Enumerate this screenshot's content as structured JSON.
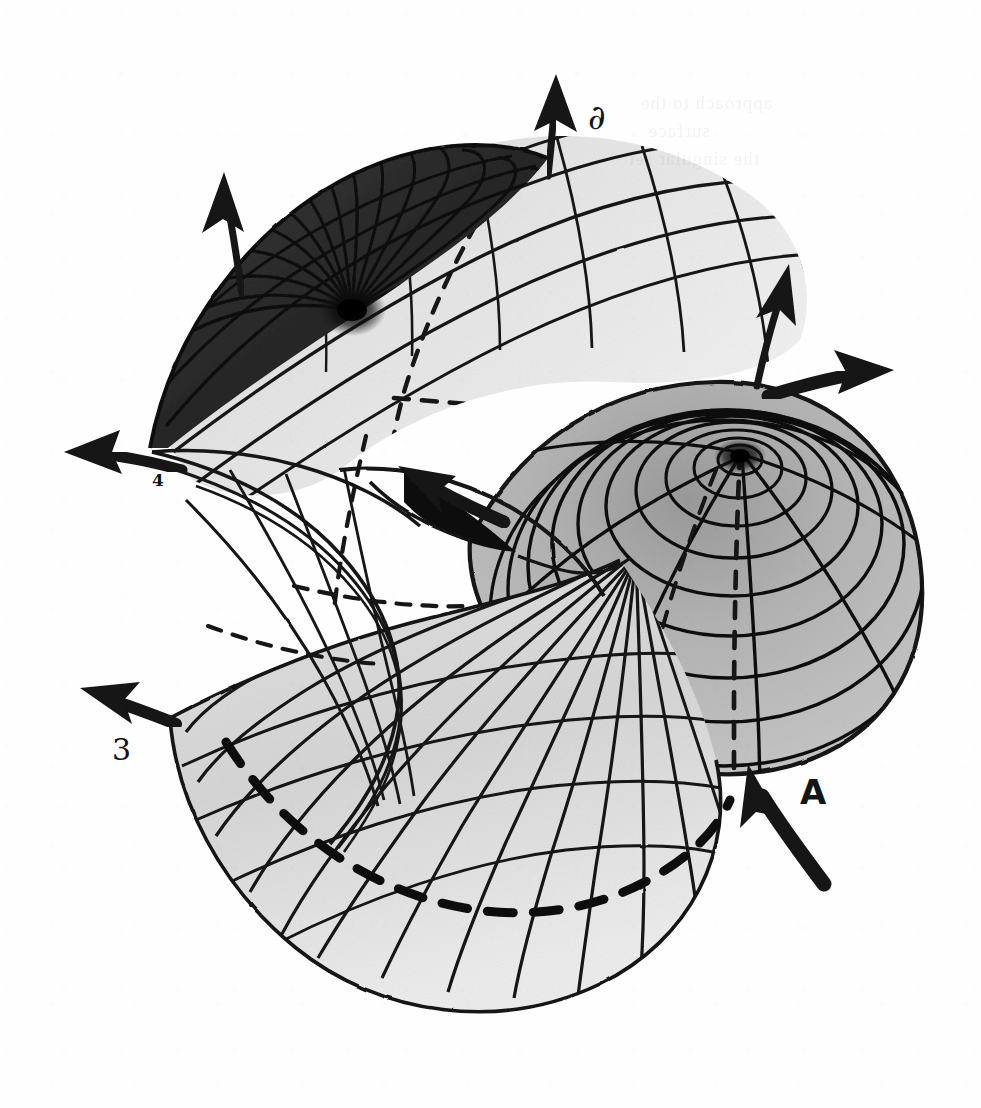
{
  "figure": {
    "medium": "ink and wash drawing on paper, scanned",
    "background_color": "#fefefe",
    "ink_color": "#141414",
    "canvas": {
      "width": 981,
      "height": 1108
    }
  },
  "labels": [
    {
      "id": "partial",
      "text": "∂",
      "x": 588,
      "y": 100,
      "role": "sheet-label-upper-right"
    },
    {
      "id": "four",
      "text": "4",
      "x": 152,
      "y": 472,
      "role": "sheet-label-left"
    },
    {
      "id": "three",
      "text": "3",
      "x": 112,
      "y": 735,
      "role": "sheet-label-lower-left"
    },
    {
      "id": "A",
      "text": "A",
      "x": 800,
      "y": 775,
      "role": "point-label-lower-right"
    }
  ],
  "arrows": [
    {
      "id": "arrow-top-center",
      "style": "thin-straight",
      "label": "∂",
      "direction": "up",
      "tip_x": 556,
      "tip_y": 78,
      "tail_x": 548,
      "tail_y": 175
    },
    {
      "id": "arrow-top-left",
      "style": "thin-straight",
      "label": "",
      "direction": "up",
      "tip_x": 224,
      "tip_y": 178,
      "tail_x": 240,
      "tail_y": 292
    },
    {
      "id": "arrow-upper-right",
      "style": "thin-straight",
      "label": "",
      "direction": "up-right",
      "tip_x": 786,
      "tip_y": 268,
      "tail_x": 757,
      "tail_y": 382
    },
    {
      "id": "arrow-right-curved",
      "style": "thick-curved",
      "label": "",
      "direction": "right",
      "tip_x": 888,
      "tip_y": 373,
      "tail_x": 770,
      "tail_y": 396
    },
    {
      "id": "arrow-left-curved",
      "style": "thick-curved",
      "label": "4",
      "direction": "left",
      "tip_x": 70,
      "tip_y": 455,
      "tail_x": 180,
      "tail_y": 468
    },
    {
      "id": "arrow-lower-left",
      "style": "thick-curved",
      "label": "3",
      "direction": "up-left",
      "tip_x": 86,
      "tip_y": 692,
      "tail_x": 172,
      "tail_y": 722
    },
    {
      "id": "arrow-center",
      "style": "thick-tapered",
      "label": "",
      "direction": "up-left",
      "tip_x": 404,
      "tip_y": 470,
      "tail_x": 500,
      "tail_y": 520
    },
    {
      "id": "arrow-A",
      "style": "thick-tapered",
      "label": "A",
      "direction": "up-left",
      "tip_x": 752,
      "tip_y": 768,
      "tail_x": 822,
      "tail_y": 880
    }
  ],
  "regions": [
    {
      "id": "upper-left-dark-lobe",
      "shading": "dark",
      "description": "densely shaded fan converging to a focal cusp point"
    },
    {
      "id": "upper-band",
      "shading": "light",
      "description": "striped band sweeping right with hidden dashed curve"
    },
    {
      "id": "right-dome",
      "shading": "medium",
      "description": "concentric oval contours with radial meridians around an umbilic centre"
    },
    {
      "id": "lower-fan",
      "shading": "light",
      "description": "radial fan of generators crossed by a heavy dashed arc"
    },
    {
      "id": "left-cusp-wedge",
      "shading": "none",
      "description": "white cusped wedge between the sheets"
    }
  ],
  "line_styles": {
    "visible_contour": "solid",
    "hidden_contour": "dashed",
    "heavy_fold": "solid-thick"
  },
  "ghost_text": [
    {
      "text": "approach to the",
      "x": 640,
      "y": 104
    },
    {
      "text": "surface",
      "x": 648,
      "y": 132
    },
    {
      "text": "the singular set",
      "x": 628,
      "y": 160
    }
  ]
}
